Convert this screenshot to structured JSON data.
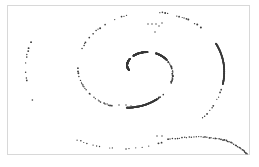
{
  "figure": {
    "title": "",
    "background_color": "#ffffff",
    "border_color": "#d8d8d8",
    "card": {
      "x": 7,
      "y": 5,
      "width": 243,
      "height": 150
    }
  },
  "chart_data": {
    "type": "scatter",
    "title": "",
    "subtitle": "",
    "xlabel": "",
    "ylabel": "",
    "xlim": [
      0,
      259
    ],
    "ylim": [
      0,
      167
    ],
    "grid": false,
    "legend": null,
    "annotations": [],
    "marker": {
      "shape": "circle",
      "color": "#3a3a3a",
      "size_px": 1.5
    },
    "series": [
      {
        "name": "spiral",
        "parametrization": "archimedean",
        "center": [
          138,
          70
        ],
        "theta_start_deg": 190,
        "theta_end_deg": 1010,
        "radius_start": 9,
        "radius_end": 128,
        "aspect_x": 1.0,
        "aspect_y": 0.78,
        "rotation_deg": -8,
        "point_count": 430,
        "spacing_noise": 0.55,
        "gaps_deg": [
          [
            248,
            262
          ],
          [
            300,
            318
          ],
          [
            398,
            418
          ],
          [
            470,
            486
          ],
          [
            556,
            572
          ],
          [
            628,
            650
          ],
          [
            690,
            706
          ],
          [
            775,
            800
          ],
          [
            862,
            884
          ],
          [
            930,
            948
          ]
        ],
        "solid_ranges_deg": [
          [
            190,
            300
          ],
          [
            300,
            345
          ],
          [
            430,
            470
          ],
          [
            690,
            742
          ]
        ]
      },
      {
        "name": "tail",
        "kind": "polyline-dotted",
        "points": [
          [
            168,
            139
          ],
          [
            180,
            138
          ],
          [
            192,
            137
          ],
          [
            204,
            137
          ],
          [
            214,
            138
          ],
          [
            224,
            140
          ],
          [
            232,
            143
          ],
          [
            239,
            147
          ],
          [
            244,
            151
          ],
          [
            247,
            154
          ]
        ],
        "point_count": 46
      },
      {
        "name": "stray-dots",
        "kind": "points",
        "points": [
          [
            148,
            24
          ],
          [
            152,
            24
          ],
          [
            156,
            24
          ],
          [
            159,
            26
          ],
          [
            162,
            23
          ],
          [
            155,
            32
          ],
          [
            119,
            105
          ],
          [
            126,
            105
          ],
          [
            131,
            106
          ],
          [
            137,
            106
          ],
          [
            157,
            136
          ],
          [
            162,
            136
          ]
        ]
      }
    ]
  }
}
